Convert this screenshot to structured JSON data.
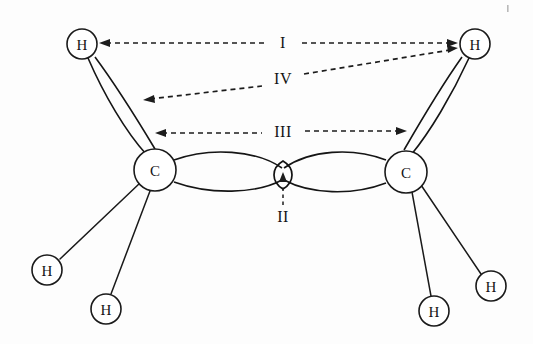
{
  "figure": {
    "background_color": "#fdfdfd",
    "line_color": "#1a1a1a"
  },
  "atoms": [
    {
      "id": "h-top-left",
      "label": "H",
      "x": 82,
      "y": 44,
      "r": 15
    },
    {
      "id": "h-top-right",
      "label": "H",
      "x": 475,
      "y": 44,
      "r": 15
    },
    {
      "id": "c-left",
      "label": "C",
      "x": 155,
      "y": 170,
      "r": 21
    },
    {
      "id": "c-right",
      "label": "C",
      "x": 406,
      "y": 172,
      "r": 21
    },
    {
      "id": "h-bottom-left-1",
      "label": "H",
      "x": 47,
      "y": 270,
      "r": 15
    },
    {
      "id": "h-bottom-left-2",
      "label": "H",
      "x": 106,
      "y": 309,
      "r": 15
    },
    {
      "id": "h-bottom-right-1",
      "label": "H",
      "x": 434,
      "y": 311,
      "r": 15
    },
    {
      "id": "h-bottom-right-2",
      "label": "H",
      "x": 491,
      "y": 286,
      "r": 15
    }
  ],
  "annotations": [
    {
      "id": "annot-I",
      "label": "I",
      "label_x": 283,
      "label_y": 42,
      "description": "H to H distance across the molecule (top hydrogens)"
    },
    {
      "id": "annot-II",
      "label": "II",
      "label_x": 283,
      "label_y": 216,
      "description": "Pi overlap region between the two carbon orbital lobes"
    },
    {
      "id": "annot-III",
      "label": "III",
      "label_x": 283,
      "label_y": 131,
      "description": "C to C overlap lobe span"
    },
    {
      "id": "annot-IV",
      "label": "IV",
      "label_x": 283,
      "label_y": 78,
      "description": "C-H bonding lobe to opposite H"
    }
  ],
  "labels_order": [
    "I",
    "IV",
    "III",
    "II"
  ]
}
